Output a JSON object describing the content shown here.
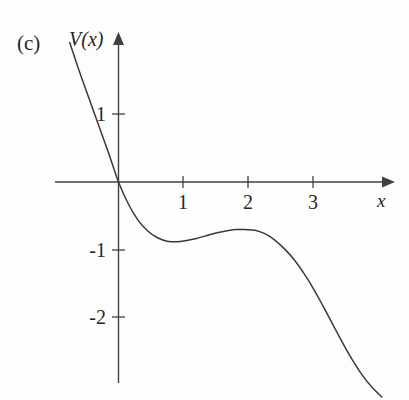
{
  "figure": {
    "panel_label": "(c)",
    "yaxis_title": "V(x)",
    "xaxis_title": "x",
    "background_color": "#fdfdfd",
    "curve_color": "#3a3a3a",
    "axis_color": "#404040"
  },
  "chart_data": {
    "type": "line",
    "title": "(c)",
    "xlabel": "x",
    "ylabel": "V(x)",
    "xlim": [
      -0.97,
      4.15
    ],
    "ylim": [
      -2.95,
      2.12
    ],
    "grid": false,
    "legend": null,
    "xticks": [
      1,
      2,
      3
    ],
    "xtick_labels": [
      "1",
      "2",
      "3"
    ],
    "yticks": [
      1,
      -1,
      -2
    ],
    "ytick_labels": [
      "1",
      "-1",
      "-2"
    ],
    "axes_style": "arrowed-spines-through-origin",
    "series": [
      {
        "name": "V(x)",
        "x": [
          -0.75,
          -0.6,
          -0.45,
          -0.3,
          -0.15,
          0.0,
          0.15,
          0.3,
          0.45,
          0.6,
          0.75,
          0.9,
          1.05,
          1.2,
          1.35,
          1.5,
          1.65,
          1.8,
          1.95,
          2.1,
          2.25,
          2.4,
          2.55,
          2.7,
          2.85,
          3.0,
          3.15,
          3.3,
          3.45,
          3.6,
          3.75,
          3.9,
          4.05
        ],
        "y": [
          2.05,
          1.62,
          1.22,
          0.82,
          0.42,
          0.0,
          -0.32,
          -0.56,
          -0.72,
          -0.82,
          -0.87,
          -0.88,
          -0.86,
          -0.83,
          -0.79,
          -0.75,
          -0.72,
          -0.7,
          -0.7,
          -0.71,
          -0.76,
          -0.85,
          -0.98,
          -1.14,
          -1.34,
          -1.57,
          -1.83,
          -2.1,
          -2.37,
          -2.62,
          -2.84,
          -3.02,
          -3.16
        ]
      }
    ],
    "annotations": [
      {
        "name": "local-minimum",
        "x": 0.97,
        "y": -0.88
      },
      {
        "name": "local-maximum",
        "x": 1.97,
        "y": -0.7
      },
      {
        "name": "origin-crossing",
        "x": 0.0,
        "y": 0.0
      }
    ]
  }
}
